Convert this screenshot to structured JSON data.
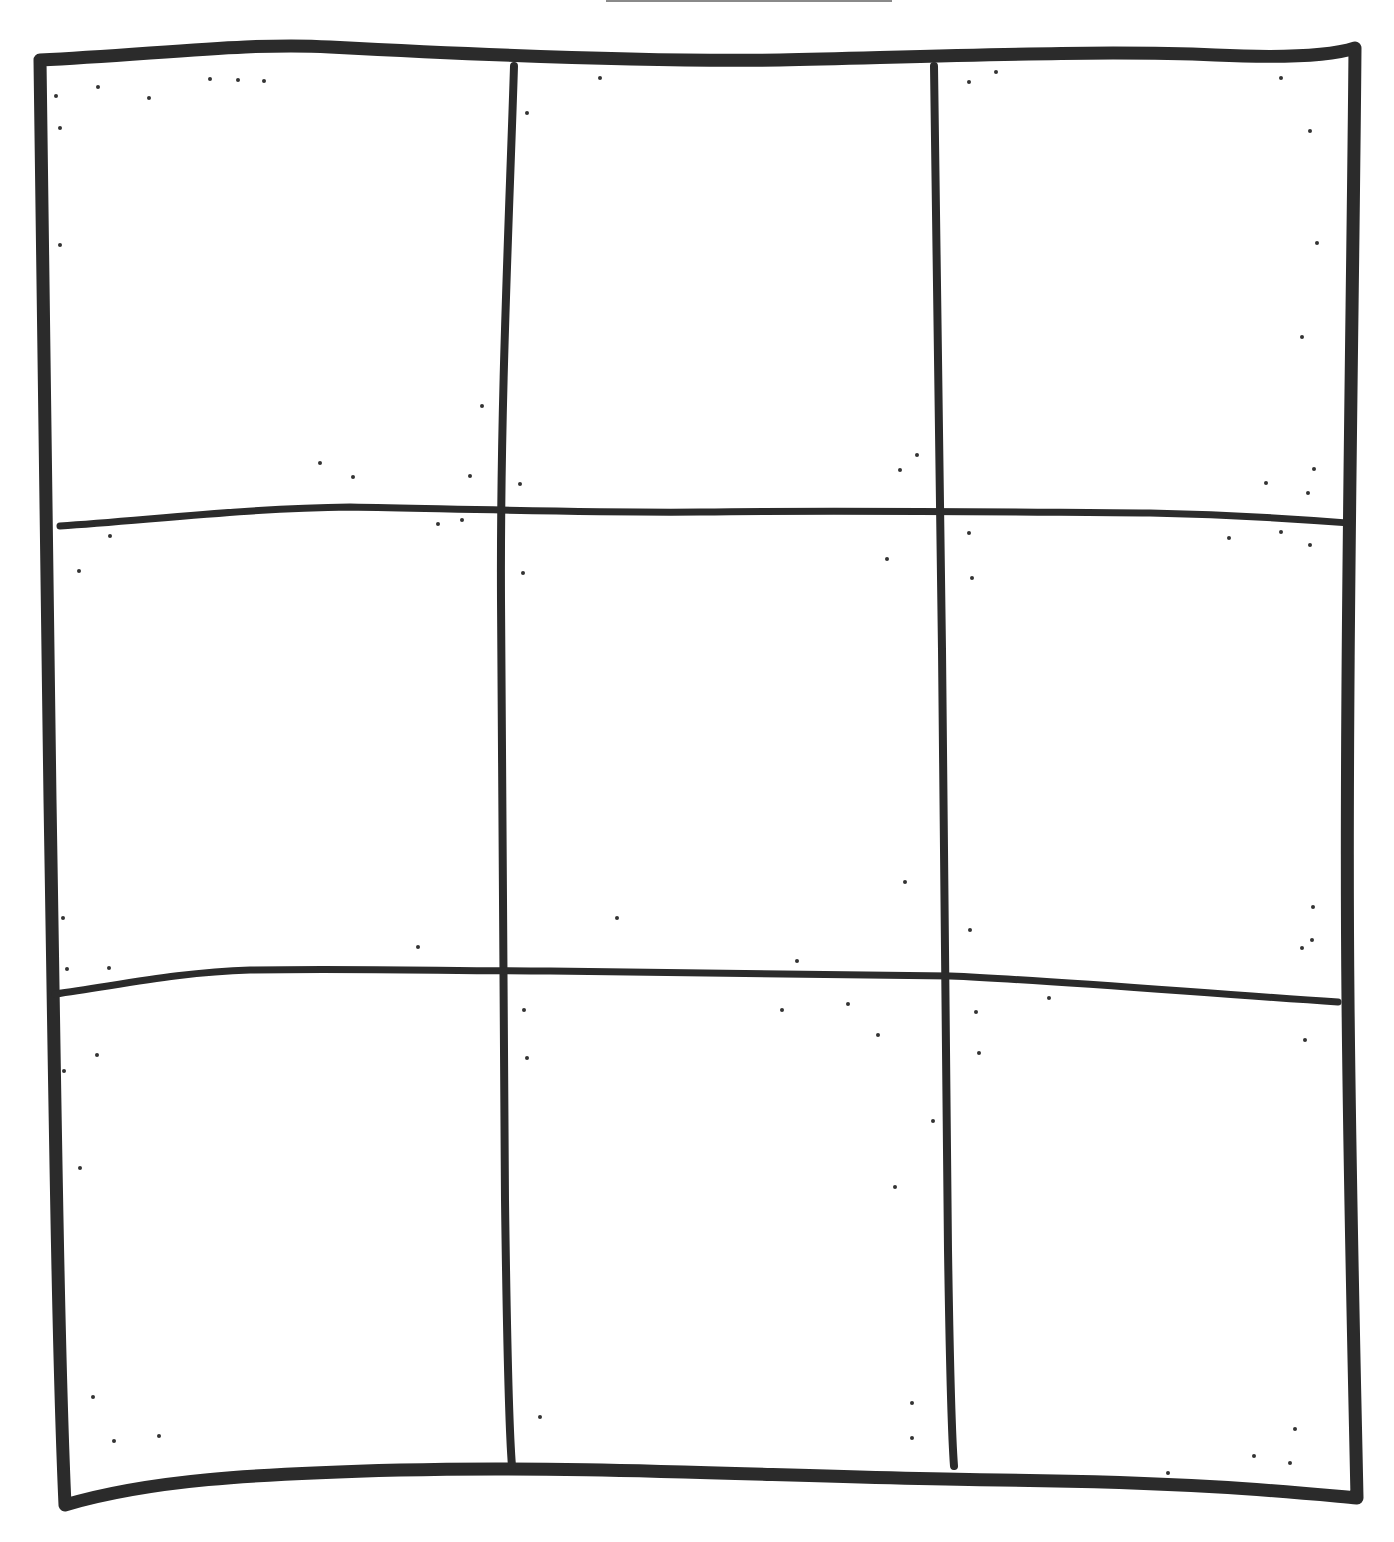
{
  "page": {
    "width": 1394,
    "height": 1542,
    "background": "#ffffff"
  },
  "colors": {
    "ink": "#2b2b2b",
    "top_rule": "#8a8a8a",
    "speckle": "#333333"
  },
  "top_rule": {
    "x1": 606,
    "y1": 1,
    "x2": 892,
    "y2": 1,
    "width": 2
  },
  "grid": {
    "rows": 3,
    "cols": 3,
    "outer_border": {
      "path": "M 40 60 C 150 55, 250 42, 330 47 C 500 56, 650 62, 780 60 C 950 56, 1100 50, 1215 55 C 1280 58, 1330 56, 1355 48 C 1353 300, 1345 700, 1348 1000 C 1350 1200, 1355 1400, 1357 1498 C 1300 1493, 1200 1482, 1000 1480 C 800 1478, 600 1465, 400 1470 C 250 1474, 150 1480, 65 1505 C 58 1350, 55 1100, 50 800 C 47 500, 42 250, 40 60 Z",
      "width": 13
    },
    "vertical_lines": [
      {
        "name": "left-divider",
        "path": "M 514 66 C 510 200, 500 400, 501 600 C 502 800, 503 1000, 505 1200 C 507 1350, 509 1430, 512 1466",
        "width": 8
      },
      {
        "name": "right-divider",
        "path": "M 934 66 C 935 250, 940 450, 942 650 C 944 850, 946 1050, 948 1250 C 950 1380, 952 1440, 954 1466",
        "width": 8
      }
    ],
    "horizontal_lines": [
      {
        "name": "upper-divider",
        "path": "M 60 526 C 150 520, 250 508, 350 507 C 500 510, 600 513, 700 512 C 850 510, 1000 512, 1150 513 C 1250 515, 1310 520, 1348 523",
        "width": 7
      },
      {
        "name": "lower-divider",
        "path": "M 55 994 C 120 985, 180 972, 250 970 C 350 968, 450 971, 550 971 C 700 972, 850 974, 950 976 C 1050 980, 1200 993, 1338 1002",
        "width": 7
      }
    ],
    "cells": [
      {
        "id": "r1c1",
        "x": 50,
        "y": 62,
        "w": 458,
        "h": 452
      },
      {
        "id": "r1c2",
        "x": 510,
        "y": 62,
        "w": 428,
        "h": 452
      },
      {
        "id": "r1c3",
        "x": 940,
        "y": 62,
        "w": 410,
        "h": 452
      },
      {
        "id": "r2c1",
        "x": 50,
        "y": 516,
        "w": 455,
        "h": 462
      },
      {
        "id": "r2c2",
        "x": 505,
        "y": 516,
        "w": 437,
        "h": 462
      },
      {
        "id": "r2c3",
        "x": 944,
        "y": 516,
        "w": 406,
        "h": 462
      },
      {
        "id": "r3c1",
        "x": 55,
        "y": 980,
        "w": 452,
        "h": 488
      },
      {
        "id": "r3c2",
        "x": 507,
        "y": 980,
        "w": 442,
        "h": 488
      },
      {
        "id": "r3c3",
        "x": 951,
        "y": 980,
        "w": 402,
        "h": 488
      }
    ]
  },
  "speckles": [
    [
      56,
      96
    ],
    [
      98,
      87
    ],
    [
      149,
      98
    ],
    [
      210,
      79
    ],
    [
      238,
      80
    ],
    [
      264,
      81
    ],
    [
      60,
      128
    ],
    [
      60,
      245
    ],
    [
      527,
      113
    ],
    [
      600,
      78
    ],
    [
      969,
      82
    ],
    [
      996,
      72
    ],
    [
      1281,
      78
    ],
    [
      1310,
      131
    ],
    [
      1317,
      243
    ],
    [
      1302,
      337
    ],
    [
      482,
      406
    ],
    [
      320,
      463
    ],
    [
      353,
      477
    ],
    [
      470,
      476
    ],
    [
      520,
      484
    ],
    [
      900,
      470
    ],
    [
      917,
      455
    ],
    [
      1266,
      483
    ],
    [
      1314,
      469
    ],
    [
      1308,
      493
    ],
    [
      110,
      536
    ],
    [
      79,
      571
    ],
    [
      438,
      524
    ],
    [
      462,
      520
    ],
    [
      523,
      573
    ],
    [
      887,
      559
    ],
    [
      969,
      533
    ],
    [
      972,
      578
    ],
    [
      1229,
      538
    ],
    [
      1281,
      532
    ],
    [
      1310,
      545
    ],
    [
      905,
      882
    ],
    [
      617,
      918
    ],
    [
      63,
      918
    ],
    [
      67,
      969
    ],
    [
      109,
      968
    ],
    [
      418,
      947
    ],
    [
      797,
      961
    ],
    [
      970,
      930
    ],
    [
      1313,
      907
    ],
    [
      1302,
      948
    ],
    [
      1312,
      940
    ],
    [
      524,
      1010
    ],
    [
      782,
      1010
    ],
    [
      848,
      1004
    ],
    [
      878,
      1035
    ],
    [
      1049,
      998
    ],
    [
      976,
      1012
    ],
    [
      97,
      1055
    ],
    [
      64,
      1071
    ],
    [
      527,
      1058
    ],
    [
      979,
      1053
    ],
    [
      1305,
      1040
    ],
    [
      933,
      1121
    ],
    [
      80,
      1168
    ],
    [
      895,
      1187
    ],
    [
      93,
      1397
    ],
    [
      114,
      1441
    ],
    [
      159,
      1436
    ],
    [
      540,
      1417
    ],
    [
      912,
      1403
    ],
    [
      912,
      1438
    ],
    [
      1295,
      1429
    ],
    [
      1254,
      1456
    ],
    [
      1290,
      1463
    ],
    [
      1168,
      1473
    ]
  ]
}
